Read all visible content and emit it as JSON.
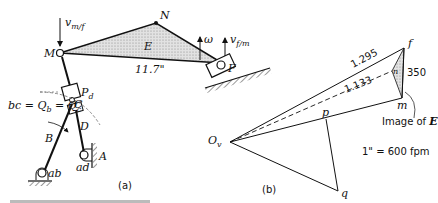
{
  "figure_a": {
    "caption": "(a)",
    "link_E_label": "E",
    "point_M": "M",
    "point_N": "N",
    "point_F": "F",
    "point_A": "A",
    "point_C": "C",
    "point_Pd": "P",
    "point_Pd_sub": "d",
    "link_B": "B",
    "link_D": "D",
    "pivot_ab": "ab",
    "pivot_ad": "ad",
    "velocity_m_f": "v",
    "velocity_m_f_sub": "m/f",
    "velocity_f_m": "v",
    "velocity_f_m_sub": "f/m",
    "omega": "ω",
    "dimension": "11.7\"",
    "pole_eq": "bc = Q",
    "pole_eq_b": "b",
    "pole_eq_mid": " = Q",
    "pole_eq_c": "c"
  },
  "figure_b": {
    "caption": "(b)",
    "origin": "O",
    "origin_sub": "v",
    "point_f": "f",
    "point_n": "n",
    "point_m": "m",
    "point_p": "p",
    "point_q": "q",
    "len_of": "1.295",
    "len_on": "1.133",
    "len_fm": "350",
    "image_label": "Image of ",
    "image_label_E": "E",
    "scale": "1\" = 600 fpm"
  },
  "colors": {
    "ink": "#111111",
    "shade": "#c8c8c8"
  }
}
